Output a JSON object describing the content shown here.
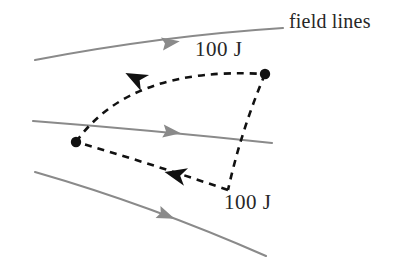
{
  "figure": {
    "background_color": "#ffffff",
    "width": 404,
    "height": 261,
    "colors": {
      "field_line": "#8a8a8a",
      "path": "#111111",
      "text": "#272727",
      "dot": "#111111"
    },
    "labels": {
      "field_lines": "field lines",
      "work_top": "100 J",
      "work_bottom": "100 J"
    },
    "field_lines": [
      {
        "name": "field-line-top",
        "start": [
          35,
          60
        ],
        "control": [
          160,
          36
        ],
        "end": [
          283,
          28
        ],
        "arrow_at": [
          162,
          44
        ],
        "arrow_angle_deg": -9
      },
      {
        "name": "field-line-middle",
        "start": [
          33,
          121
        ],
        "control": [
          150,
          130
        ],
        "end": [
          272,
          143
        ],
        "arrow_at": [
          163,
          131
        ],
        "arrow_angle_deg": 7
      },
      {
        "name": "field-line-bottom",
        "start": [
          35,
          172
        ],
        "control": [
          150,
          205
        ],
        "end": [
          266,
          256
        ],
        "arrow_at": [
          158,
          212
        ],
        "arrow_angle_deg": 22
      }
    ],
    "path_points": [
      {
        "name": "vertex-left",
        "x": 76,
        "y": 142
      },
      {
        "name": "vertex-right-top",
        "x": 265,
        "y": 74
      },
      {
        "name": "vertex-bottom",
        "x": 228,
        "y": 190
      }
    ],
    "path_segments": [
      {
        "name": "arc-top",
        "from": [
          76,
          142
        ],
        "control": [
          130,
          66
        ],
        "to": [
          265,
          74
        ],
        "arrow_at": [
          145,
          83
        ],
        "arrow_angle_deg": 207,
        "work_label": "100 J"
      },
      {
        "name": "edge-right",
        "from": [
          265,
          74
        ],
        "control": [
          240,
          130
        ],
        "to": [
          228,
          190
        ],
        "arrow_at": null,
        "arrow_angle_deg": null,
        "work_label": null
      },
      {
        "name": "edge-bottom",
        "from": [
          228,
          190
        ],
        "control": [
          150,
          163
        ],
        "to": [
          76,
          142
        ],
        "arrow_at": [
          186,
          177
        ],
        "arrow_angle_deg": 193,
        "work_label": "100 J"
      }
    ]
  }
}
